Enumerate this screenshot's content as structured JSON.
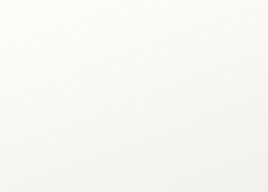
{
  "figure": {
    "kind": "expanding-balloon-universe-diagram",
    "balloon_count": 4,
    "galaxy_labels": [
      "A",
      "B",
      "C",
      "D"
    ]
  },
  "text_top": {
    "lines": [
      "e, we see galaxies t",
      "vere 1 billion years",
      "ears away as they",
      "tory of galaxies",
      "encoded"
    ]
  },
  "text_bottom": {
    "lines": [
      "th",
      "dime",
      "mu"
    ]
  },
  "balloons": [
    {
      "id": "balloon-1",
      "size_order": 1,
      "shade": "dark",
      "markers": [
        {
          "label": "D"
        },
        {
          "label": "C"
        },
        {
          "label": "B"
        },
        {
          "label": "A"
        }
      ],
      "plain_dots": 0
    },
    {
      "id": "balloon-2",
      "size_order": 2,
      "shade": "light",
      "markers": [],
      "plain_dots": 4
    },
    {
      "id": "balloon-3",
      "size_order": 3,
      "shade": "dark",
      "markers": [
        {
          "label": "C"
        },
        {
          "label": "B"
        },
        {
          "label": "A"
        }
      ],
      "plain_dots": 3
    },
    {
      "id": "balloon-4",
      "size_order": 4,
      "shade": "dark",
      "markers": [
        {
          "label": "D"
        },
        {
          "label": "C"
        },
        {
          "label": "B"
        },
        {
          "label": "A"
        }
      ],
      "plain_dots": 0
    }
  ],
  "colors": {
    "page_background": "#fcfbf8",
    "ink": "#2b2a28",
    "balloon_dark_mid": "#767673",
    "balloon_light_mid": "#d6d5d0",
    "galaxy_dot": "#1c1c1e",
    "marker_text": "#f6f5f2"
  }
}
